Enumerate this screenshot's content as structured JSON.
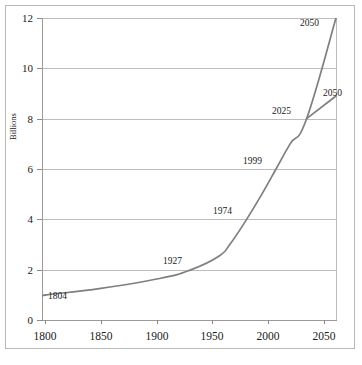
{
  "chart_data": {
    "type": "line",
    "title": "",
    "xlabel": "",
    "ylabel": "Billions",
    "xlim": [
      1800,
      2050
    ],
    "ylim": [
      0,
      12
    ],
    "grid": true,
    "legend": "none",
    "x_ticks": [
      1800,
      1850,
      1900,
      1950,
      2000,
      2050
    ],
    "y_ticks": [
      0,
      2,
      4,
      6,
      8,
      10,
      12
    ],
    "annotations": [
      {
        "label": "1804",
        "x": 1804,
        "y": 1.0
      },
      {
        "label": "1927",
        "x": 1927,
        "y": 2.0
      },
      {
        "label": "1974",
        "x": 1974,
        "y": 4.0
      },
      {
        "label": "1999",
        "x": 1999,
        "y": 6.0
      },
      {
        "label": "2025",
        "x": 2025,
        "y": 8.0
      },
      {
        "label": "2050",
        "x": 2050,
        "y": 12.0
      },
      {
        "label": "2050",
        "x": 2050,
        "y": 8.9
      }
    ],
    "series": [
      {
        "name": "World population (historical and high projection)",
        "color": "#7f7f7f",
        "x": [
          1800,
          1804,
          1850,
          1900,
          1927,
          1950,
          1960,
          1974,
          1987,
          1999,
          2011,
          2025,
          2050
        ],
        "values": [
          0.95,
          1.0,
          1.26,
          1.65,
          2.0,
          2.52,
          3.02,
          4.0,
          5.0,
          6.0,
          7.0,
          8.0,
          12.0
        ]
      },
      {
        "name": "World population (low projection)",
        "color": "#7f7f7f",
        "x": [
          2025,
          2050
        ],
        "values": [
          8.0,
          8.9
        ]
      }
    ]
  },
  "axis_labels": {
    "y": [
      "12",
      "10",
      "8",
      "6",
      "4",
      "2",
      "0"
    ],
    "x": [
      "1800",
      "1850",
      "1900",
      "1950",
      "2000",
      "2050"
    ],
    "y_title": "Billions"
  },
  "point_labels": {
    "p1804": "1804",
    "p1927": "1927",
    "p1974": "1974",
    "p1999": "1999",
    "p2025": "2025",
    "p2050_high": "2050",
    "p2050_low": "2050"
  },
  "colors": {
    "line": "#7f7f7f",
    "grid": "#bdbdbd",
    "axis": "#9a9a9a",
    "text": "#1a1a1a",
    "background": "#ffffff"
  }
}
